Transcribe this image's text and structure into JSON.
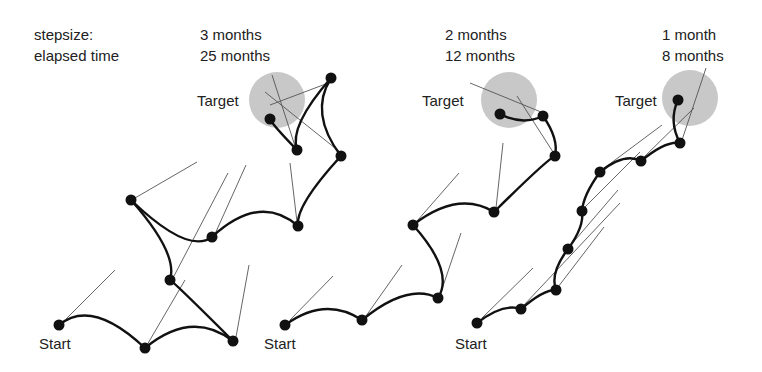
{
  "header": {
    "stepsize_label": "stepsize:",
    "elapsed_label": "elapsed time"
  },
  "panels": [
    {
      "stepsize": "3 months",
      "elapsed": "25 months",
      "target_label": "Target",
      "start_label": "Start",
      "target": {
        "cx": 277,
        "cy": 100,
        "r": 28
      },
      "points": [
        [
          59,
          325
        ],
        [
          145,
          348
        ],
        [
          233,
          341
        ],
        [
          170,
          280
        ],
        [
          131,
          200
        ],
        [
          212,
          237
        ],
        [
          298,
          226
        ],
        [
          341,
          156
        ],
        [
          331,
          78
        ],
        [
          297,
          150
        ],
        [
          270,
          119
        ]
      ],
      "bulge": [
        -0.45,
        -0.4,
        0.45,
        -0.35,
        0.45,
        -0.45,
        0.35,
        0.35,
        -0.35,
        0.35
      ],
      "tangents": [
        [
          [
            66,
            319
          ],
          [
            115,
            270
          ]
        ],
        [
          [
            147,
            345
          ],
          [
            185,
            280
          ]
        ],
        [
          [
            236,
            337
          ],
          [
            249,
            265
          ]
        ],
        [
          [
            174,
            276
          ],
          [
            228,
            173
          ]
        ],
        [
          [
            135,
            198
          ],
          [
            197,
            162
          ]
        ],
        [
          [
            215,
            234
          ],
          [
            246,
            165
          ]
        ],
        [
          [
            297,
            222
          ],
          [
            290,
            163
          ]
        ],
        [
          [
            340,
            152
          ],
          [
            265,
            92
          ]
        ],
        [
          [
            331,
            82
          ],
          [
            270,
            105
          ]
        ],
        [
          [
            295,
            146
          ],
          [
            272,
            75
          ]
        ]
      ]
    },
    {
      "stepsize": "2 months",
      "elapsed": "12 months",
      "target_label": "Target",
      "start_label": "Start",
      "target": {
        "cx": 509,
        "cy": 100,
        "r": 28
      },
      "points": [
        [
          285,
          325
        ],
        [
          362,
          320
        ],
        [
          438,
          298
        ],
        [
          413,
          225
        ],
        [
          494,
          212
        ],
        [
          555,
          156
        ],
        [
          543,
          116
        ],
        [
          500,
          114
        ]
      ],
      "bulge": [
        -0.35,
        -0.35,
        -0.4,
        -0.35,
        -0.4,
        -0.25,
        -0.25
      ],
      "tangents": [
        [
          [
            290,
            320
          ],
          [
            333,
            276
          ]
        ],
        [
          [
            366,
            316
          ],
          [
            402,
            265
          ]
        ],
        [
          [
            440,
            295
          ],
          [
            461,
            233
          ]
        ],
        [
          [
            417,
            221
          ],
          [
            459,
            173
          ]
        ],
        [
          [
            496,
            208
          ],
          [
            503,
            143
          ]
        ],
        [
          [
            553,
            152
          ],
          [
            517,
            96
          ]
        ],
        [
          [
            541,
            112
          ],
          [
            470,
            83
          ]
        ]
      ]
    },
    {
      "stepsize": "1 month",
      "elapsed": "8 months",
      "target_label": "Target",
      "start_label": "Start",
      "target": {
        "cx": 690,
        "cy": 98,
        "r": 28
      },
      "points": [
        [
          477,
          323
        ],
        [
          521,
          309
        ],
        [
          556,
          290
        ],
        [
          568,
          249
        ],
        [
          582,
          211
        ],
        [
          600,
          172
        ],
        [
          641,
          161
        ],
        [
          680,
          143
        ],
        [
          678,
          100
        ]
      ],
      "bulge": [
        -0.3,
        -0.3,
        0.3,
        -0.25,
        0.2,
        -0.35,
        -0.3,
        0.25
      ],
      "tangents": [
        [
          [
            482,
            318
          ],
          [
            533,
            268
          ]
        ],
        [
          [
            524,
            305
          ],
          [
            620,
            203
          ]
        ],
        [
          [
            558,
            287
          ],
          [
            604,
            227
          ]
        ],
        [
          [
            570,
            246
          ],
          [
            618,
            190
          ]
        ],
        [
          [
            584,
            208
          ],
          [
            640,
            152
          ]
        ],
        [
          [
            603,
            169
          ],
          [
            662,
            125
          ]
        ],
        [
          [
            643,
            158
          ],
          [
            694,
            108
          ]
        ],
        [
          [
            682,
            140
          ],
          [
            706,
            68
          ]
        ]
      ]
    }
  ]
}
